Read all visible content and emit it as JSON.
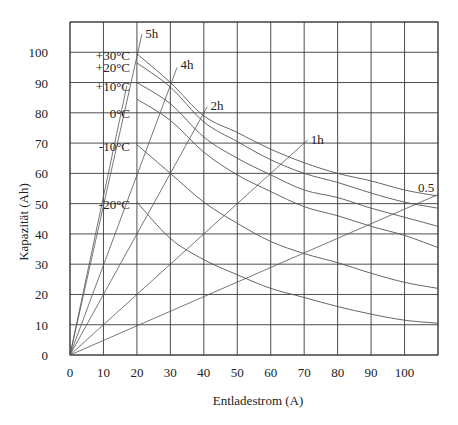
{
  "chart_data": {
    "type": "line",
    "title": "",
    "xlabel": "Entladestrom (A)",
    "ylabel": "Kapazität (Ah)",
    "xlim": [
      0,
      110
    ],
    "ylim": [
      0,
      110
    ],
    "grid": true,
    "x_ticks": [
      0,
      10,
      20,
      30,
      40,
      50,
      60,
      70,
      80,
      90,
      100
    ],
    "y_ticks": [
      0,
      10,
      20,
      30,
      40,
      50,
      60,
      70,
      80,
      90,
      100
    ],
    "series": [
      {
        "name": "+30°C",
        "x": [
          20,
          30,
          40,
          50,
          60,
          70,
          80,
          90,
          100,
          110
        ],
        "values": [
          99.5,
          90,
          79,
          73.5,
          68,
          63.5,
          60,
          57.5,
          54.5,
          52.5
        ]
      },
      {
        "name": "+20°C",
        "x": [
          20,
          30,
          40,
          50,
          60,
          70,
          80,
          90,
          100,
          110
        ],
        "values": [
          96.5,
          88.5,
          77,
          70.5,
          64.5,
          60,
          57,
          53.5,
          50.5,
          48.5
        ]
      },
      {
        "name": "+10°C",
        "x": [
          20,
          30,
          40,
          50,
          60,
          70,
          80,
          90,
          100,
          110
        ],
        "values": [
          90,
          83,
          72,
          65,
          59.5,
          54.5,
          52,
          48.5,
          45.5,
          42.5
        ]
      },
      {
        "name": "0°C",
        "x": [
          20,
          30,
          40,
          50,
          60,
          70,
          80,
          90,
          100,
          110
        ],
        "values": [
          84.5,
          77.5,
          67,
          59.5,
          54,
          49,
          46,
          42.5,
          39.5,
          35.5
        ]
      },
      {
        "name": "-10°C",
        "x": [
          20,
          30,
          40,
          50,
          60,
          70,
          80,
          90,
          100,
          110
        ],
        "values": [
          69.5,
          60,
          50.5,
          43.5,
          37.5,
          33.5,
          30.5,
          27,
          24,
          22
        ]
      },
      {
        "name": "-20°C",
        "x": [
          20,
          30,
          40,
          50,
          60,
          70,
          80,
          90,
          100,
          110
        ],
        "values": [
          50.5,
          38.5,
          31.5,
          26.5,
          22,
          19,
          16,
          13.5,
          11.5,
          10.5
        ]
      }
    ],
    "rate_lines": [
      {
        "name": "5h",
        "end": [
          21.5,
          106
        ]
      },
      {
        "name": "",
        "end": [
          17,
          89
        ]
      },
      {
        "name": "4h",
        "end": [
          32,
          95
        ]
      },
      {
        "name": "2h",
        "end": [
          41,
          82
        ]
      },
      {
        "name": "1h",
        "end": [
          71,
          71
        ]
      },
      {
        "name": "0.5",
        "end": [
          110,
          53
        ]
      }
    ],
    "annotations": [
      {
        "text": "5h",
        "x": 22.5,
        "y": 106.5
      },
      {
        "text": "4h",
        "x": 33,
        "y": 96
      },
      {
        "text": "2h",
        "x": 42,
        "y": 82.5
      },
      {
        "text": "1h",
        "x": 72,
        "y": 71.5
      },
      {
        "text": "0.5",
        "x": 104,
        "y": 55.5
      },
      {
        "text": "+30°C",
        "x": 8,
        "y": 99
      },
      {
        "text": "+20°C",
        "x": 8,
        "y": 95
      },
      {
        "text": "+10°C",
        "x": 8,
        "y": 89
      },
      {
        "text": "0°C",
        "x": 8,
        "y": 80
      },
      {
        "text": "-10°C",
        "x": 8,
        "y": 69
      },
      {
        "text": "-20°C",
        "x": 8,
        "y": 50
      }
    ],
    "legend_position": "none"
  }
}
